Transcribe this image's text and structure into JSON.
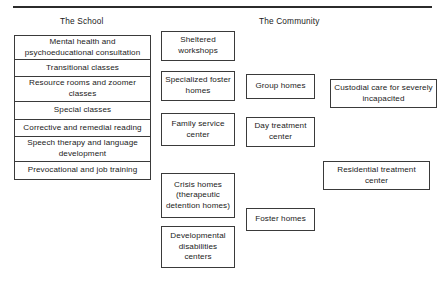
{
  "figure": {
    "columns": [
      {
        "id": "school",
        "title": "The School"
      },
      {
        "id": "community",
        "title": "The Community"
      }
    ],
    "school_services": [
      {
        "label": "Mental health and psychoeducational consultation",
        "height": 24
      },
      {
        "label": "Transitional classes",
        "height": 17
      },
      {
        "label": "Resource rooms and zoomer classes",
        "height": 25
      },
      {
        "label": "Special classes",
        "height": 18
      },
      {
        "label": "Corrective and remedial reading",
        "height": 17
      },
      {
        "label": "Speech therapy and language development",
        "height": 25
      },
      {
        "label": "Prevocational and job training",
        "height": 17
      }
    ],
    "community_column_2": [
      {
        "label": "Sheltered workshops",
        "x": 161,
        "y": 31,
        "w": 74,
        "h": 30
      },
      {
        "label": "Specialized foster homes",
        "x": 161,
        "y": 71,
        "w": 74,
        "h": 30
      },
      {
        "label": "Family service center",
        "x": 161,
        "y": 113,
        "w": 74,
        "h": 33
      },
      {
        "label": "Crisis homes (therapeutic detention homes)",
        "x": 161,
        "y": 173,
        "w": 74,
        "h": 45
      },
      {
        "label": "Developmental disabilities centers",
        "x": 161,
        "y": 226,
        "w": 74,
        "h": 42
      }
    ],
    "community_column_3": [
      {
        "label": "Group homes",
        "x": 246,
        "y": 74,
        "w": 69,
        "h": 25
      },
      {
        "label": "Day treatment center",
        "x": 246,
        "y": 117,
        "w": 69,
        "h": 30
      },
      {
        "label": "Foster homes",
        "x": 246,
        "y": 208,
        "w": 69,
        "h": 23
      }
    ],
    "community_column_4": [
      {
        "label": "Custodial care for severely incapacited",
        "x": 330,
        "y": 79,
        "w": 107,
        "h": 29
      },
      {
        "label": "Residential treatment center",
        "x": 323,
        "y": 161,
        "w": 107,
        "h": 29
      }
    ]
  }
}
